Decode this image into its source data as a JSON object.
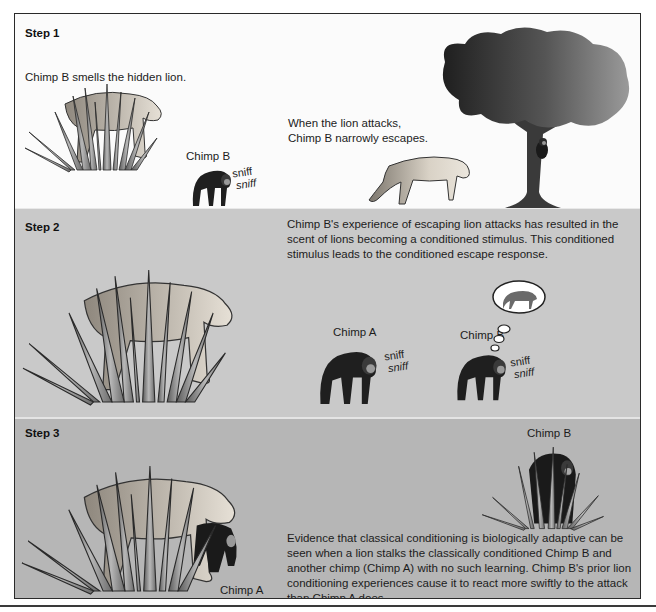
{
  "figure": {
    "colors": {
      "border": "#2a2a2a",
      "step1_bg": "#fbfbfb",
      "step2_bg": "#c9c9c9",
      "step3_bg": "#b6b6b6",
      "chimp": "#1f1f1f",
      "lion": "#c8c0b4",
      "grass": "#8a8a8a",
      "tree": "#4a4a4a"
    }
  },
  "steps": [
    {
      "label": "Step 1",
      "caption_left": "Chimp B smells the hidden lion.",
      "caption_right_line1": "When the lion attacks,",
      "caption_right_line2": "Chimp B narrowly escapes.",
      "chimp_label": "Chimp B",
      "sniff": [
        "sniff",
        "sniff"
      ],
      "illustrations": [
        "lion-hidden-in-grass",
        "chimp-sniffing",
        "lion-attacking",
        "tree-with-escaped-chimp"
      ]
    },
    {
      "label": "Step 2",
      "caption": "Chimp B's experience of escaping lion attacks has resulted in the scent of lions becoming a conditioned stimulus. This conditioned stimulus leads to the conditioned escape response.",
      "caption_lines": [
        "Chimp B's experience of escaping lion attacks has resulted in the",
        "scent of lions becoming a conditioned stimulus. This conditioned",
        "stimulus leads to the conditioned escape response."
      ],
      "chimp_a_label": "Chimp A",
      "chimp_b_label": "Chimp B",
      "sniff_a": [
        "sniff",
        "sniff"
      ],
      "sniff_b": [
        "sniff",
        "sniff"
      ],
      "thought_bubble": "lion-memory",
      "illustrations": [
        "lion-hidden-in-grass",
        "chimp-a-sniffing",
        "chimp-b-sniffing-thinking-of-lion"
      ]
    },
    {
      "label": "Step 3",
      "chimp_b_label": "Chimp B",
      "chimp_a_label": "Chimp A",
      "caption": "Evidence that classical conditioning is biologically adaptive can be seen when a lion stalks the classically conditioned Chimp B and another chimp (Chimp A) with no such learning. Chimp B's prior lion conditioning experiences cause it to react more swiftly to the attack than Chimp A does.",
      "caption_lines": [
        "Evidence that classical conditioning is biologically adaptive can be",
        "seen when a lion stalks the classically conditioned Chimp B and",
        "another chimp (Chimp A) with no such learning. Chimp B's prior lion",
        "conditioning experiences cause it to react more swiftly to the attack",
        "than Chimp A does."
      ],
      "illustrations": [
        "lion-catching-chimp-a",
        "chimp-b-hiding-in-grass"
      ]
    }
  ]
}
